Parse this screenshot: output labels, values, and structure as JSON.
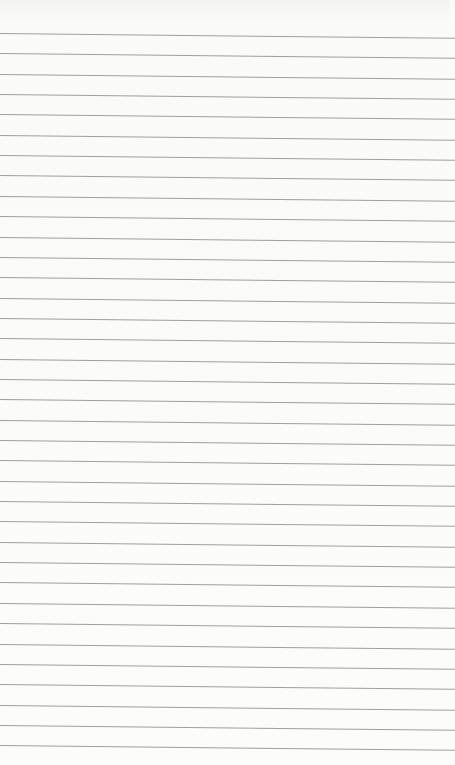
{
  "paper": {
    "line_count": 36,
    "first_line_y": 33,
    "line_spacing": 20.35,
    "line_color": "#8e8e8e",
    "background_color": "#fbfbfa"
  }
}
